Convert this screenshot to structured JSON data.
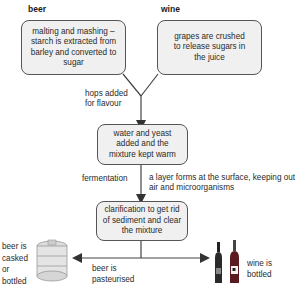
{
  "headers": {
    "beer": "beer",
    "wine": "wine"
  },
  "boxes": {
    "malting": "malting and mashing – starch is extracted from barley and converted to sugar",
    "grapes": "grapes are crushed to release sugars in the juice",
    "water_yeast": "water and yeast added and the mixture kept warm",
    "clarification": "clarification to get rid of sediment and clear the mixture"
  },
  "labels": {
    "hops": "hops added for flavour",
    "fermentation": "fermentation",
    "layer": "a layer forms at the surface, keeping out air and microorganisms",
    "pasteurised": "beer is pasteurised",
    "casked": "beer is casked or bottled",
    "wine_bottled": "wine is bottled"
  },
  "icons": {
    "cask": "beer-cask-icon",
    "bottles": "wine-bottles-icon"
  },
  "colors": {
    "box_fill": "#f0f0f0",
    "box_border": "#555555",
    "line": "#444444"
  }
}
